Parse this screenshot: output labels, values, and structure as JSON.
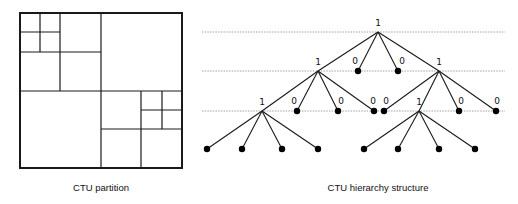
{
  "captions": {
    "left": "CTU partition",
    "right": "CTU hierarchy structure"
  },
  "partition": {
    "outer": {
      "x": 20,
      "y": 13,
      "w": 162,
      "h": 155
    },
    "lines": [
      {
        "x1": 101,
        "y1": 13,
        "x2": 101,
        "y2": 168
      },
      {
        "x1": 20,
        "y1": 91,
        "x2": 182,
        "y2": 91
      },
      {
        "x1": 60,
        "y1": 13,
        "x2": 60,
        "y2": 91
      },
      {
        "x1": 20,
        "y1": 52,
        "x2": 101,
        "y2": 52
      },
      {
        "x1": 40,
        "y1": 13,
        "x2": 40,
        "y2": 52
      },
      {
        "x1": 20,
        "y1": 32,
        "x2": 60,
        "y2": 32
      },
      {
        "x1": 141,
        "y1": 91,
        "x2": 141,
        "y2": 168
      },
      {
        "x1": 101,
        "y1": 129,
        "x2": 182,
        "y2": 129
      },
      {
        "x1": 162,
        "y1": 91,
        "x2": 162,
        "y2": 129
      },
      {
        "x1": 141,
        "y1": 110,
        "x2": 182,
        "y2": 110
      }
    ]
  },
  "tree": {
    "level_lines_y": [
      32,
      71,
      111
    ],
    "level_line_x_range": [
      202,
      505
    ],
    "nodes": [
      {
        "id": "root",
        "x": 378,
        "y": 32,
        "label": "1",
        "leaf": false,
        "lx": 378,
        "ly": 26
      },
      {
        "id": "n1a",
        "x": 318,
        "y": 71,
        "label": "1",
        "leaf": false,
        "lx": 318,
        "ly": 65
      },
      {
        "id": "n1b",
        "x": 358,
        "y": 71,
        "label": "0",
        "leaf": true,
        "lx": 355,
        "ly": 64
      },
      {
        "id": "n1c",
        "x": 398,
        "y": 71,
        "label": "0",
        "leaf": true,
        "lx": 402,
        "ly": 64
      },
      {
        "id": "n1d",
        "x": 439,
        "y": 71,
        "label": "1",
        "leaf": false,
        "lx": 439,
        "ly": 65
      },
      {
        "id": "n2a",
        "x": 262,
        "y": 111,
        "label": "1",
        "leaf": false,
        "lx": 262,
        "ly": 105
      },
      {
        "id": "n2b",
        "x": 297,
        "y": 111,
        "label": "0",
        "leaf": true,
        "lx": 294,
        "ly": 104
      },
      {
        "id": "n2c",
        "x": 338,
        "y": 111,
        "label": "0",
        "leaf": true,
        "lx": 341,
        "ly": 104
      },
      {
        "id": "n2d",
        "x": 374,
        "y": 111,
        "label": "0",
        "leaf": true,
        "lx": 373,
        "ly": 104
      },
      {
        "id": "n2e",
        "x": 384,
        "y": 111,
        "label": "0",
        "leaf": true,
        "lx": 386,
        "ly": 104
      },
      {
        "id": "n2f",
        "x": 419,
        "y": 111,
        "label": "1",
        "leaf": false,
        "lx": 419,
        "ly": 105
      },
      {
        "id": "n2g",
        "x": 459,
        "y": 111,
        "label": "0",
        "leaf": true,
        "lx": 461,
        "ly": 104
      },
      {
        "id": "n2h",
        "x": 496,
        "y": 111,
        "label": "0",
        "leaf": true,
        "lx": 497,
        "ly": 104
      },
      {
        "id": "n3a",
        "x": 207,
        "y": 149,
        "label": "",
        "leaf": true
      },
      {
        "id": "n3b",
        "x": 242,
        "y": 149,
        "label": "",
        "leaf": true
      },
      {
        "id": "n3c",
        "x": 282,
        "y": 149,
        "label": "",
        "leaf": true
      },
      {
        "id": "n3d",
        "x": 318,
        "y": 149,
        "label": "",
        "leaf": true
      },
      {
        "id": "n3e",
        "x": 364,
        "y": 149,
        "label": "",
        "leaf": true
      },
      {
        "id": "n3f",
        "x": 398,
        "y": 149,
        "label": "",
        "leaf": true
      },
      {
        "id": "n3g",
        "x": 439,
        "y": 149,
        "label": "",
        "leaf": true
      },
      {
        "id": "n3h",
        "x": 475,
        "y": 149,
        "label": "",
        "leaf": true
      }
    ],
    "edges": [
      [
        "root",
        "n1a"
      ],
      [
        "root",
        "n1b"
      ],
      [
        "root",
        "n1c"
      ],
      [
        "root",
        "n1d"
      ],
      [
        "n1a",
        "n2a"
      ],
      [
        "n1a",
        "n2b"
      ],
      [
        "n1a",
        "n2c"
      ],
      [
        "n1a",
        "n2d"
      ],
      [
        "n1d",
        "n2e"
      ],
      [
        "n1d",
        "n2f"
      ],
      [
        "n1d",
        "n2g"
      ],
      [
        "n1d",
        "n2h"
      ],
      [
        "n2a",
        "n3a"
      ],
      [
        "n2a",
        "n3b"
      ],
      [
        "n2a",
        "n3c"
      ],
      [
        "n2a",
        "n3d"
      ],
      [
        "n2f",
        "n3e"
      ],
      [
        "n2f",
        "n3f"
      ],
      [
        "n2f",
        "n3g"
      ],
      [
        "n2f",
        "n3h"
      ]
    ]
  }
}
